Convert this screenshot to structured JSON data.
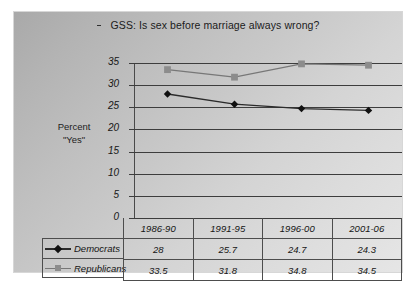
{
  "chart_data": {
    "type": "line",
    "title": "GSS: Is sex before marriage always wrong?",
    "title_bullet": "dash-bullet",
    "xlabel": "",
    "ylabel": "Percent \"Yes\"",
    "ylabel_line1": "Percent",
    "ylabel_line2": "\"Yes\"",
    "categories": [
      "1986-90",
      "1991-95",
      "1996-00",
      "2001-06"
    ],
    "series": [
      {
        "name": "Democrats",
        "values": [
          28,
          25.7,
          24.7,
          24.3
        ],
        "display_values": [
          "28",
          "25.7",
          "24.7",
          "24.3"
        ],
        "color": "#2b2b2b",
        "marker": "diamond",
        "marker_color": "#111111"
      },
      {
        "name": "Republicans",
        "values": [
          33.5,
          31.8,
          34.8,
          34.5
        ],
        "display_values": [
          "33.5",
          "31.8",
          "34.8",
          "34.5"
        ],
        "color": "#777777",
        "marker": "square",
        "marker_color": "#8c8c8c"
      }
    ],
    "ylim": [
      0,
      35
    ],
    "y_ticks": [
      0,
      5,
      10,
      15,
      20,
      25,
      30,
      35
    ],
    "y_tick_labels": [
      "0",
      "5",
      "10",
      "15",
      "20",
      "25",
      "30",
      "35"
    ],
    "grid": true,
    "legend_position": "data-table-left",
    "has_data_table": true
  },
  "colors": {
    "democrat_line": "#2b2b2b",
    "republican_line": "#777777",
    "gridline": "#3d3d3d",
    "axis": "#4a4a4a",
    "table_border": "#4d4d4d",
    "background_dark": "#a9a9a9",
    "background_light": "#e6e6e6"
  }
}
